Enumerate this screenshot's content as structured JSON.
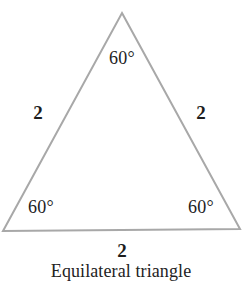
{
  "figure": {
    "name": "equilateral-triangle-figure",
    "caption": "Equilateral triangle",
    "background_color": "#ffffff",
    "stroke_color": "#a8a8a8",
    "text_color": "#1d1d1d",
    "stroke_width": 2,
    "width": 242,
    "height": 282
  },
  "shape": {
    "type": "triangle",
    "classification": "equilateral",
    "vertices": [
      {
        "id": "apex",
        "x": 122,
        "y": 13
      },
      {
        "id": "bottom-right",
        "x": 240,
        "y": 229
      },
      {
        "id": "bottom-left",
        "x": 3,
        "y": 231
      }
    ],
    "points_attr": "122,13 240,229 3,231"
  },
  "angles": [
    {
      "id": "apex",
      "value": "60°",
      "x": 122,
      "y": 58
    },
    {
      "id": "bottom-left",
      "value": "60°",
      "x": 41,
      "y": 207
    },
    {
      "id": "bottom-right",
      "value": "60°",
      "x": 201,
      "y": 207
    }
  ],
  "sides": [
    {
      "id": "left",
      "value": "2",
      "x": 38,
      "y": 112
    },
    {
      "id": "right",
      "value": "2",
      "x": 201,
      "y": 112
    },
    {
      "id": "bottom",
      "value": "2",
      "x": 122,
      "y": 250
    }
  ],
  "caption_position": {
    "y": 270
  }
}
